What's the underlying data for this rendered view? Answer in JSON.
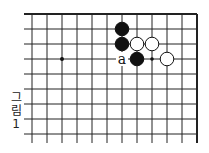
{
  "diagram": {
    "caption": [
      "그",
      "림",
      "1"
    ],
    "grid": {
      "origin_x": 32,
      "origin_y": 14,
      "spacing": 15,
      "columns": 12,
      "rows": 9,
      "line_color": "#222222",
      "top_edge": true,
      "right_edge": true
    },
    "hoshi": [
      {
        "col": 2,
        "row": 3
      }
    ],
    "stones": [
      {
        "col": 6,
        "row": 1,
        "color": "black"
      },
      {
        "col": 6,
        "row": 2,
        "color": "black"
      },
      {
        "col": 7,
        "row": 2,
        "color": "white"
      },
      {
        "col": 8,
        "row": 2,
        "color": "white"
      },
      {
        "col": 7,
        "row": 3,
        "color": "black"
      },
      {
        "col": 9,
        "row": 3,
        "color": "white"
      }
    ],
    "markers": [
      {
        "col": 8,
        "row": 3,
        "type": "dot"
      }
    ],
    "labels": [
      {
        "col": 6,
        "row": 3,
        "text": "a"
      }
    ]
  }
}
